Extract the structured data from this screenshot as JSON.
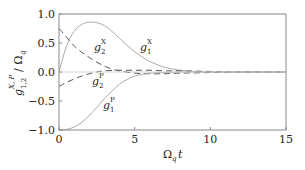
{
  "chart_data": {
    "type": "line",
    "title": "",
    "xlabel": "Ω_q t",
    "ylabel": "g_{1,2}^{X,P} / Ω_q",
    "xlim": [
      0,
      15
    ],
    "ylim": [
      -1.0,
      1.0
    ],
    "xticks": [
      "0",
      "5",
      "10",
      "15"
    ],
    "yticks": [
      "1.0",
      "0.5",
      "0.0",
      "−0.5",
      "−1.0"
    ],
    "grid": false,
    "legend": "inline annotations",
    "series": [
      {
        "name": "g1^X",
        "style": "solid",
        "x": [
          0,
          0.5,
          1,
          1.5,
          2,
          2.5,
          3,
          3.5,
          4,
          4.5,
          5,
          5.5,
          6,
          7,
          8,
          9,
          10,
          12,
          15
        ],
        "y": [
          0,
          0.45,
          0.7,
          0.82,
          0.86,
          0.85,
          0.8,
          0.7,
          0.58,
          0.46,
          0.35,
          0.26,
          0.18,
          0.08,
          0.03,
          0.01,
          0.0,
          0.0,
          0.0
        ]
      },
      {
        "name": "g2^X",
        "style": "dashed",
        "x": [
          0,
          0.5,
          1,
          1.5,
          2,
          2.5,
          3,
          3.5,
          4,
          5,
          6,
          7,
          8,
          10,
          12,
          15
        ],
        "y": [
          0.75,
          0.6,
          0.45,
          0.34,
          0.25,
          0.17,
          0.1,
          0.05,
          0.02,
          -0.02,
          -0.03,
          -0.03,
          -0.02,
          -0.01,
          0.0,
          0.0
        ]
      },
      {
        "name": "g2^P",
        "style": "dashed",
        "x": [
          0,
          0.5,
          1,
          1.5,
          2,
          2.5,
          3,
          4,
          5,
          6,
          7,
          8,
          10,
          12,
          15
        ],
        "y": [
          -0.25,
          -0.18,
          -0.12,
          -0.07,
          -0.03,
          0.0,
          0.02,
          0.03,
          0.03,
          0.03,
          0.02,
          0.02,
          0.01,
          0.0,
          0.0
        ]
      },
      {
        "name": "g1^P",
        "style": "solid",
        "x": [
          0,
          0.5,
          1,
          1.5,
          2,
          2.5,
          3,
          3.5,
          4,
          4.5,
          5,
          5.5,
          6,
          7,
          8,
          10,
          15
        ],
        "y": [
          -1.0,
          -0.99,
          -0.95,
          -0.87,
          -0.75,
          -0.61,
          -0.46,
          -0.33,
          -0.21,
          -0.13,
          -0.07,
          -0.04,
          -0.02,
          -0.01,
          0.0,
          0.0,
          0.0
        ]
      }
    ],
    "annotations": [
      {
        "text": "g2^X",
        "x": 2.5,
        "y": 0.42
      },
      {
        "text": "g1^X",
        "x": 5.4,
        "y": 0.44
      },
      {
        "text": "g2^P",
        "x": 2.4,
        "y": -0.18
      },
      {
        "text": "g1^P",
        "x": 3.3,
        "y": -0.56
      }
    ]
  },
  "labels": {
    "g": "g",
    "x_sup": "X",
    "p_sup": "P",
    "sub1": "1",
    "sub2": "2",
    "xlabel_omega": "Ω",
    "xlabel_sub": "q",
    "xlabel_t": "t",
    "ylabel": "g",
    "ylabel_sup": "X, P",
    "ylabel_sub": "1,2",
    "ylabel_rest": "/ Ω",
    "ylabel_rest_sub": "q"
  },
  "colors": {
    "axes": "#888888",
    "solid": "#aaaaaa",
    "dashed": "#555555",
    "zero": "#cccccc"
  }
}
